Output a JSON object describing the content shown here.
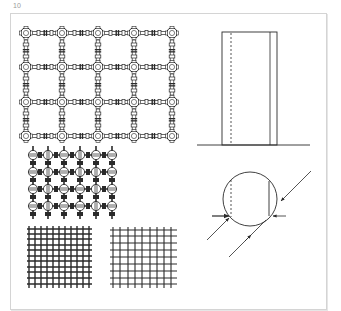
{
  "figure": {
    "number": "10",
    "colors": {
      "ink": "#2a2a2a",
      "frame": "#d4d4d4",
      "label": "#9a9a9a"
    },
    "panels": [
      {
        "id": "node-grid-large",
        "description": "Lattice of cross-shaped connector nodes joined by segmented bars",
        "columns": 5,
        "rows": 4
      },
      {
        "id": "column-elevation",
        "description": "Tall rectangle elevation on a ground line with dashed hidden edge"
      },
      {
        "id": "node-grid-small",
        "description": "Dense lattice of spherical nodes with short bars",
        "columns": 6,
        "rows": 4
      },
      {
        "id": "circle-section",
        "description": "Circle section with dashed chord, solid chord and directional arrows"
      },
      {
        "id": "dense-mesh",
        "description": "Dense woven mesh pattern"
      },
      {
        "id": "open-mesh",
        "description": "Open crossed line grid pattern"
      }
    ]
  }
}
